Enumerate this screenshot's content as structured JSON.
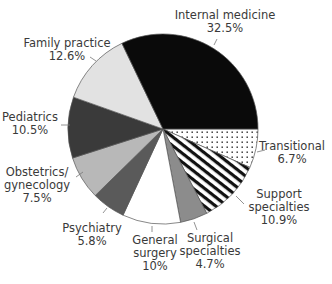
{
  "chart_data": {
    "type": "pie",
    "title": "",
    "start_angle_deg": 0,
    "direction": "clockwise",
    "slices": [
      {
        "label": "Transitional",
        "value": 6.7,
        "value_label": "6.7%",
        "fill": "dots"
      },
      {
        "label": "Support specialties",
        "value": 10.9,
        "value_label": "10.9%",
        "fill": "stripes"
      },
      {
        "label": "Surgical specialties",
        "value": 4.7,
        "value_label": "4.7%",
        "fill": "#8c8c8c"
      },
      {
        "label": "General surgery",
        "value": 10,
        "value_label": "10%",
        "fill": "#ffffff"
      },
      {
        "label": "Psychiatry",
        "value": 5.8,
        "value_label": "5.8%",
        "fill": "#5a5a5a"
      },
      {
        "label": "Obstetrics/gynecology",
        "value": 7.5,
        "value_label": "7.5%",
        "fill": "#b8b8b8"
      },
      {
        "label": "Pediatrics",
        "value": 10.5,
        "value_label": "10.5%",
        "fill": "#3a3a3a"
      },
      {
        "label": "Family practice",
        "value": 12.6,
        "value_label": "12.6%",
        "fill": "#e2e2e2"
      },
      {
        "label": "Internal medicine",
        "value": 32.5,
        "value_label": "32.5%",
        "fill": "#0a0a0a"
      }
    ],
    "labels": [
      {
        "lines": [
          "Transitional",
          "6.7%"
        ],
        "x": 292,
        "y": 150,
        "lx1": 257,
        "ly1": 152,
        "lx2": 265,
        "ly2": 150
      },
      {
        "lines": [
          "Support",
          "specialties",
          "10.9%"
        ],
        "x": 279,
        "y": 198,
        "lx1": 236,
        "ly1": 196,
        "lx2": 244,
        "ly2": 204
      },
      {
        "lines": [
          "Surgical",
          "specialties",
          "4.7%"
        ],
        "x": 210,
        "y": 242,
        "lx1": 194,
        "ly1": 222,
        "lx2": 197,
        "ly2": 230
      },
      {
        "lines": [
          "General",
          "surgery",
          "10%"
        ],
        "x": 155,
        "y": 244,
        "lx1": 152,
        "ly1": 226,
        "lx2": 152,
        "ly2": 232
      },
      {
        "lines": [
          "Psychiatry",
          "5.8%"
        ],
        "x": 92,
        "y": 232,
        "lx1": 107,
        "ly1": 208,
        "lx2": 103,
        "ly2": 213
      },
      {
        "lines": [
          "Obstetrics/",
          "gynecology",
          "7.5%"
        ],
        "x": 37,
        "y": 176,
        "lx1": 83,
        "ly1": 172,
        "lx2": 76,
        "ly2": 177
      },
      {
        "lines": [
          "Pediatrics",
          "10.5%"
        ],
        "x": 30,
        "y": 121,
        "lx1": 70,
        "ly1": 125,
        "lx2": 61,
        "ly2": 125
      },
      {
        "lines": [
          "Family practice",
          "12.6%"
        ],
        "x": 67,
        "y": 47,
        "lx1": 96,
        "ly1": 61,
        "lx2": 90,
        "ly2": 57
      },
      {
        "lines": [
          "Internal medicine",
          "32.5%"
        ],
        "x": 225,
        "y": 19,
        "lx1": 214,
        "ly1": 45,
        "lx2": 217,
        "ly2": 39
      }
    ],
    "center": [
      163,
      129
    ],
    "radius": 95,
    "legend": "none"
  }
}
